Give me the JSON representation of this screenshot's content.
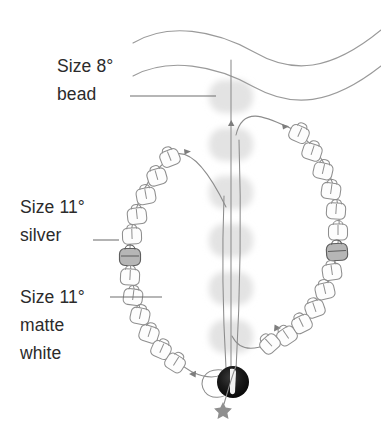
{
  "diagram": {
    "background_color": "#ffffff",
    "labels": [
      {
        "id": "size-8-bead",
        "lines": [
          "Size 8°",
          "bead"
        ],
        "line1": "Size 8°",
        "line2": "bead",
        "line3": "",
        "x": 57,
        "y": 72,
        "leader_from_x": 130,
        "leader_from_y": 96,
        "leader_to_x": 216,
        "leader_to_y": 96,
        "points_to": "center-bead-2"
      },
      {
        "id": "size-11-silver",
        "lines": [
          "Size 11°",
          "silver"
        ],
        "line1": "Size 11°",
        "line2": "silver",
        "line3": "",
        "x": 20,
        "y": 213,
        "leader_from_x": 93,
        "leader_from_y": 240,
        "leader_to_x": 119,
        "leader_to_y": 240,
        "points_to": "left-silver-bead"
      },
      {
        "id": "size-11-matte-white",
        "lines": [
          "Size 11°",
          "matte",
          "white"
        ],
        "line1": "Size 11°",
        "line2": "matte",
        "line3": "white",
        "x": 20,
        "y": 303,
        "leader_from_x": 110,
        "leader_from_y": 297,
        "leader_to_x": 162,
        "leader_to_y": 297,
        "points_to": "left-chain-bead-11"
      }
    ],
    "colors": {
      "text": "#2b2b2b",
      "thread": "#8c8c8c",
      "size8_bead_fill": "#e3e3e3",
      "size11_matte_white_fill": "#fdfdfd",
      "size11_matte_white_outline": "#8e8e8e",
      "size11_silver_fill": "#b6b6b6",
      "size11_silver_outline": "#5e5e5e",
      "focal_bead_fill": "#121212",
      "star_marker_fill": "#8f8f8f"
    },
    "center_column": {
      "name": "size-8-bead-column",
      "bead_count": 6,
      "bead_type": "Size 8° bead",
      "center_x": 231,
      "bead_width": 44,
      "bead_height": 33,
      "beads_y": [
        96,
        144,
        192,
        240,
        288,
        336
      ]
    },
    "left_chain": {
      "name": "left-bead-loop",
      "bead_type": "Size 11° matte white",
      "bead_count": 13,
      "silver_index": 5,
      "silver_type": "Size 11° silver",
      "beads": [
        {
          "x": 170,
          "y": 158,
          "rot": -22,
          "type": "matte"
        },
        {
          "x": 157,
          "y": 177,
          "rot": -16,
          "type": "matte"
        },
        {
          "x": 146,
          "y": 196,
          "rot": -10,
          "type": "matte"
        },
        {
          "x": 137,
          "y": 216,
          "rot": -6,
          "type": "matte"
        },
        {
          "x": 132,
          "y": 236,
          "rot": -2,
          "type": "matte"
        },
        {
          "x": 130,
          "y": 257,
          "rot": 0,
          "type": "silver"
        },
        {
          "x": 130,
          "y": 277,
          "rot": 3,
          "type": "matte"
        },
        {
          "x": 133,
          "y": 297,
          "rot": 7,
          "type": "matte"
        },
        {
          "x": 140,
          "y": 316,
          "rot": 12,
          "type": "matte"
        },
        {
          "x": 149,
          "y": 334,
          "rot": 18,
          "type": "matte"
        },
        {
          "x": 161,
          "y": 350,
          "rot": 24,
          "type": "matte"
        },
        {
          "x": 175,
          "y": 363,
          "rot": 32,
          "type": "matte"
        },
        {
          "x": 191,
          "y": 372,
          "rot": 40,
          "type": "matte"
        }
      ]
    },
    "right_chain": {
      "name": "right-bead-loop",
      "bead_type": "Size 11° matte white",
      "bead_count": 13,
      "silver_index": 6,
      "silver_type": "Size 11° silver",
      "beads": [
        {
          "x": 299,
          "y": 134,
          "rot": 24,
          "type": "matte"
        },
        {
          "x": 312,
          "y": 152,
          "rot": 18,
          "type": "matte"
        },
        {
          "x": 323,
          "y": 171,
          "rot": 13,
          "type": "matte"
        },
        {
          "x": 331,
          "y": 191,
          "rot": 8,
          "type": "matte"
        },
        {
          "x": 336,
          "y": 211,
          "rot": 4,
          "type": "matte"
        },
        {
          "x": 338,
          "y": 232,
          "rot": 0,
          "type": "matte"
        },
        {
          "x": 337,
          "y": 252,
          "rot": -3,
          "type": "silver"
        },
        {
          "x": 332,
          "y": 272,
          "rot": -8,
          "type": "matte"
        },
        {
          "x": 325,
          "y": 291,
          "rot": -13,
          "type": "matte"
        },
        {
          "x": 315,
          "y": 309,
          "rot": -19,
          "type": "matte"
        },
        {
          "x": 302,
          "y": 324,
          "rot": -26,
          "type": "matte"
        },
        {
          "x": 287,
          "y": 336,
          "rot": -34,
          "type": "matte"
        },
        {
          "x": 270,
          "y": 344,
          "rot": -42,
          "type": "matte"
        }
      ]
    },
    "focal_bead": {
      "name": "focal-dark-bead",
      "cx": 233,
      "cy": 382,
      "r": 16,
      "color": "#121212"
    },
    "star_marker": {
      "name": "star-marker",
      "cx": 223,
      "cy": 412,
      "size": 9,
      "color": "#8f8f8f"
    },
    "top_threads": {
      "name": "top-thread-curves",
      "count": 2,
      "description": "Two parallel wavy thread lines exiting the right edge"
    },
    "arrow_markers": {
      "name": "thread-direction-arrows",
      "count": 5,
      "positions": [
        {
          "x": 186,
          "y": 148
        },
        {
          "x": 285,
          "y": 126
        },
        {
          "x": 233,
          "y": 123
        },
        {
          "x": 278,
          "y": 331
        },
        {
          "x": 192,
          "y": 377
        }
      ]
    }
  }
}
